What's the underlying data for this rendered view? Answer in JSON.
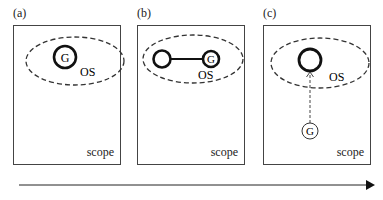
{
  "panels": [
    {
      "label": "(a)",
      "scope": "scope",
      "os": "OS",
      "goal": "G"
    },
    {
      "label": "(b)",
      "scope": "scope",
      "os": "OS",
      "goal": "G"
    },
    {
      "label": "(c)",
      "scope": "scope",
      "os": "OS",
      "goal": "G"
    }
  ],
  "timeline": {
    "direction": "right"
  }
}
